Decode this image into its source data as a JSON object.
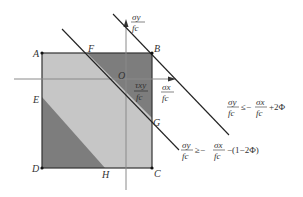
{
  "diagram": {
    "points": {
      "A": "A",
      "B": "B",
      "C": "C",
      "D": "D",
      "E": "E",
      "F": "F",
      "G": "G",
      "H": "H",
      "O": "O"
    },
    "axes": {
      "y_num": "σy",
      "y_den": "fc",
      "x_num": "σx",
      "x_den": "fc"
    },
    "shear_label": {
      "num": "τxy",
      "den": "fc"
    },
    "inequality_upper": {
      "lhs_num": "σy",
      "lhs_den": "fc",
      "op": "≤−",
      "rhs_num": "σx",
      "rhs_den": "fc",
      "tail": "+2Φ"
    },
    "inequality_lower": {
      "lhs_num": "σy",
      "lhs_den": "fc",
      "op": "≥−",
      "rhs_num": "σx",
      "rhs_den": "fc",
      "tail": "−(1−2Φ)"
    },
    "colors": {
      "light_fill": "#c8c8c8",
      "dark_fill": "#7a7a7a",
      "line": "#222222",
      "axis": "#888888"
    }
  }
}
